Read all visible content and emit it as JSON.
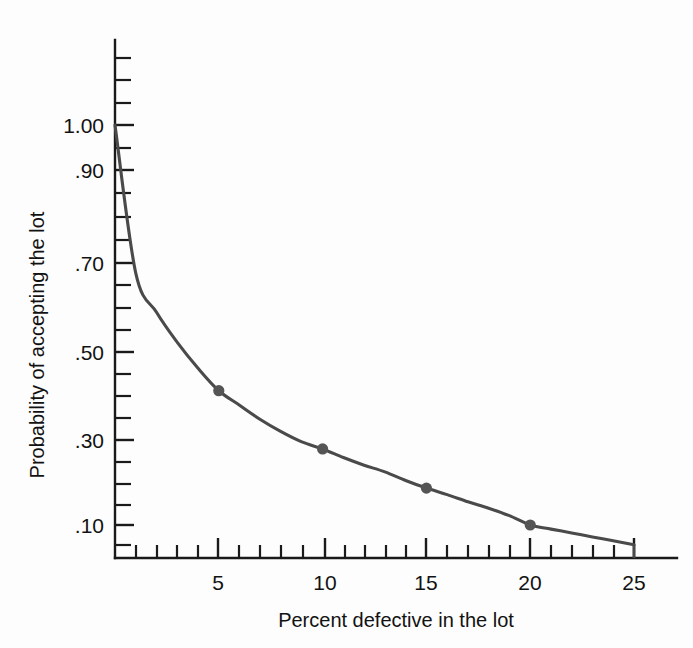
{
  "chart_data": {
    "type": "line",
    "title": "",
    "subtitle": "",
    "xlabel": "Percent defective in the lot",
    "ylabel": "Probability of accepting the lot",
    "xlim": [
      0,
      25
    ],
    "ylim": [
      0.05,
      1.0
    ],
    "y_scale": "probability",
    "grid": false,
    "legend": null,
    "x_tick_labels": [
      "5",
      "10",
      "15",
      "20",
      "25"
    ],
    "x_tick_values": [
      5,
      10,
      15,
      20,
      25
    ],
    "x_minor_tick_values": [
      1,
      2,
      3,
      4,
      6,
      7,
      8,
      9,
      11,
      12,
      13,
      14,
      16,
      17,
      18,
      19,
      21,
      22,
      23,
      24
    ],
    "y_tick_labels": [
      "1.00",
      ".90",
      ".70",
      ".50",
      ".30",
      ".10"
    ],
    "y_tick_values": [
      1.0,
      0.9,
      0.7,
      0.5,
      0.3,
      0.1
    ],
    "y_minor_tick_values": [
      0.99,
      0.98,
      0.95,
      0.8,
      0.6,
      0.4,
      0.2,
      0.15,
      0.08,
      0.06
    ],
    "series": [
      {
        "name": "Operating characteristic curve",
        "marked_points": [
          {
            "x": 5,
            "y": 0.6
          },
          {
            "x": 10,
            "y": 0.34
          },
          {
            "x": 15,
            "y": 0.195
          },
          {
            "x": 20,
            "y": 0.1
          }
        ],
        "x": [
          0,
          1,
          2,
          3,
          4,
          5,
          6,
          7,
          8,
          9,
          10,
          11,
          12,
          13,
          14,
          15,
          16,
          17,
          18,
          19,
          20,
          21,
          22,
          23,
          24,
          25
        ],
        "values": [
          1.0,
          0.945,
          0.875,
          0.79,
          0.695,
          0.6,
          0.535,
          0.47,
          0.415,
          0.37,
          0.34,
          0.305,
          0.275,
          0.25,
          0.22,
          0.195,
          0.175,
          0.155,
          0.138,
          0.12,
          0.1,
          0.092,
          0.085,
          0.078,
          0.072,
          0.066
        ],
        "color": "#4a4a4a",
        "marker_color": "#555555"
      }
    ]
  },
  "figure": {
    "background_color": "#fdfdfd",
    "axis_color": "#1a1a1a"
  }
}
